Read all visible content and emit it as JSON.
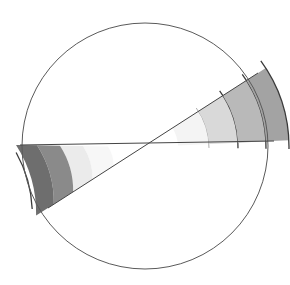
{
  "diagram": {
    "title": "",
    "description": "Hand-drawn circle with two crossing lines forming opposite wedges, each shaded in graded bands",
    "circle": {
      "cx": 145,
      "cy": 146,
      "r": 123,
      "stroke": "#5a5a5a"
    },
    "center": {
      "x": 143,
      "y": 147
    },
    "lines": [
      {
        "name": "horizontal-line",
        "x1": 20,
        "y1": 145,
        "x2": 274,
        "y2": 141
      },
      {
        "name": "diagonal-line",
        "x1": 258,
        "y1": 73,
        "x2": 48,
        "y2": 208
      }
    ],
    "wedges": [
      {
        "name": "right-wedge",
        "bands": [
          {
            "r0": 35,
            "r1": 66,
            "fill": "#f4f4f4"
          },
          {
            "r0": 66,
            "r1": 95,
            "fill": "#d9d9d9"
          },
          {
            "r0": 95,
            "r1": 123,
            "fill": "#b9b9b9"
          },
          {
            "r0": 123,
            "r1": 146,
            "fill": "#a3a3a3"
          }
        ]
      },
      {
        "name": "left-wedge",
        "bands": [
          {
            "r0": 35,
            "r1": 60,
            "fill": "#f7f7f7"
          },
          {
            "r0": 60,
            "r1": 83,
            "fill": "#ebebeb"
          },
          {
            "r0": 83,
            "r1": 106,
            "fill": "#8a8a8a"
          },
          {
            "r0": 106,
            "r1": 127,
            "fill": "#6e6e6e"
          }
        ]
      }
    ]
  }
}
